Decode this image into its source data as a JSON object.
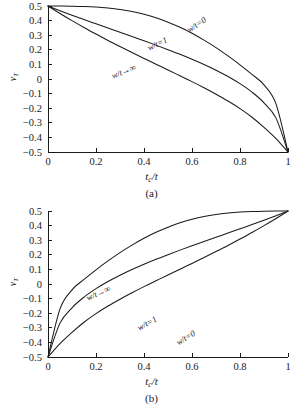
{
  "figure": {
    "background": "#ffffff",
    "line_color": "#1a1a1a"
  },
  "panels": [
    {
      "id": "a",
      "caption": "(a)",
      "xlabel_main": "t",
      "xlabel_sub": "c",
      "xlabel_tail": "/t",
      "ylabel_main": "ν",
      "ylabel_sub": "T",
      "labels": [
        {
          "name": "w-over-t-zero",
          "text": "w/t=0",
          "x": 188,
          "y": 26,
          "rot": -33
        },
        {
          "name": "w-over-t-one",
          "text": "w/t=1",
          "x": 148,
          "y": 44,
          "rot": -25
        },
        {
          "name": "w-over-t-infinity",
          "text": "w/t→∞",
          "x": 112,
          "y": 72,
          "rot": -22
        }
      ]
    },
    {
      "id": "b",
      "caption": "(b)",
      "xlabel_main": "t",
      "xlabel_sub": "c",
      "xlabel_tail": "/t",
      "ylabel_main": "ν",
      "ylabel_sub": "T",
      "labels": [
        {
          "name": "w-over-t-infinity",
          "text": "w/t→∞",
          "x": 87,
          "y": 89,
          "rot": -24
        },
        {
          "name": "w-over-t-one",
          "text": "w/t=1",
          "x": 138,
          "y": 119,
          "rot": -28
        },
        {
          "name": "w-over-t-zero",
          "text": "w/t=0",
          "x": 177,
          "y": 134,
          "rot": -32
        }
      ]
    }
  ],
  "chart_data": [
    {
      "type": "line",
      "panel": "(a)",
      "title": "",
      "xlabel": "t_c/t",
      "ylabel": "nu_T",
      "xlim": [
        0,
        1
      ],
      "ylim": [
        -0.5,
        0.5
      ],
      "grid": false,
      "legend": "inline-curve-labels",
      "xticks": [
        "0",
        "0.2",
        "0.4",
        "0.6",
        "0.8",
        "1"
      ],
      "xtick_values": [
        0,
        0.2,
        0.4,
        0.6,
        0.8,
        1
      ],
      "yticks": [
        "0.5",
        "0.4",
        "0.3",
        "0.2",
        "0.1",
        "0",
        "-0.1",
        "-0.2",
        "-0.3",
        "-0.4",
        "-0.5"
      ],
      "ytick_values": [
        0.5,
        0.4,
        0.3,
        0.2,
        0.1,
        0,
        -0.1,
        -0.2,
        -0.3,
        -0.4,
        -0.5
      ],
      "x": [
        0,
        0.05,
        0.1,
        0.15,
        0.2,
        0.25,
        0.3,
        0.35,
        0.4,
        0.45,
        0.5,
        0.55,
        0.6,
        0.65,
        0.7,
        0.75,
        0.8,
        0.85,
        0.9,
        0.95,
        1
      ],
      "series": [
        {
          "name": "w/t=0",
          "values": [
            0.5,
            0.5,
            0.499,
            0.497,
            0.493,
            0.486,
            0.476,
            0.462,
            0.443,
            0.419,
            0.389,
            0.354,
            0.313,
            0.266,
            0.215,
            0.158,
            0.097,
            0.031,
            -0.04,
            -0.17,
            -0.5
          ]
        },
        {
          "name": "w/t=1",
          "values": [
            0.5,
            0.468,
            0.437,
            0.407,
            0.378,
            0.349,
            0.32,
            0.291,
            0.262,
            0.232,
            0.201,
            0.169,
            0.135,
            0.099,
            0.06,
            0.017,
            -0.032,
            -0.09,
            -0.163,
            -0.268,
            -0.5
          ]
        },
        {
          "name": "w/t→∞",
          "values": [
            0.5,
            0.449,
            0.4,
            0.353,
            0.308,
            0.264,
            0.222,
            0.181,
            0.141,
            0.101,
            0.062,
            0.022,
            -0.018,
            -0.06,
            -0.104,
            -0.151,
            -0.203,
            -0.262,
            -0.331,
            -0.408,
            -0.5
          ]
        }
      ]
    },
    {
      "type": "line",
      "panel": "(b)",
      "title": "",
      "xlabel": "t_c/t",
      "ylabel": "nu_T",
      "xlim": [
        0,
        1
      ],
      "ylim": [
        -0.5,
        0.5
      ],
      "grid": false,
      "legend": "inline-curve-labels",
      "xticks": [
        "0",
        "0.2",
        "0.4",
        "0.6",
        "0.8",
        "1"
      ],
      "xtick_values": [
        0,
        0.2,
        0.4,
        0.6,
        0.8,
        1
      ],
      "yticks": [
        "0.5",
        "0.4",
        "0.3",
        "0.2",
        "0.1",
        "0",
        "-0.1",
        "-0.2",
        "-0.3",
        "-0.4",
        "-0.5"
      ],
      "ytick_values": [
        0.5,
        0.4,
        0.3,
        0.2,
        0.1,
        0,
        -0.1,
        -0.2,
        -0.3,
        -0.4,
        -0.5
      ],
      "x": [
        0,
        0.05,
        0.1,
        0.15,
        0.2,
        0.25,
        0.3,
        0.35,
        0.4,
        0.45,
        0.5,
        0.55,
        0.6,
        0.65,
        0.7,
        0.75,
        0.8,
        0.85,
        0.9,
        0.95,
        1
      ],
      "series": [
        {
          "name": "w/t→∞",
          "values": [
            -0.5,
            -0.408,
            -0.331,
            -0.262,
            -0.203,
            -0.151,
            -0.104,
            -0.06,
            -0.018,
            0.022,
            0.062,
            0.101,
            0.141,
            0.181,
            0.222,
            0.264,
            0.308,
            0.353,
            0.4,
            0.449,
            0.5
          ]
        },
        {
          "name": "w/t=1",
          "values": [
            -0.5,
            -0.268,
            -0.163,
            -0.09,
            -0.032,
            0.017,
            0.06,
            0.099,
            0.135,
            0.169,
            0.201,
            0.232,
            0.262,
            0.291,
            0.32,
            0.349,
            0.378,
            0.407,
            0.437,
            0.468,
            0.5
          ]
        },
        {
          "name": "w/t=0",
          "values": [
            -0.5,
            -0.17,
            -0.04,
            0.031,
            0.097,
            0.158,
            0.215,
            0.266,
            0.313,
            0.354,
            0.389,
            0.419,
            0.443,
            0.462,
            0.476,
            0.486,
            0.493,
            0.497,
            0.499,
            0.5,
            0.5
          ]
        }
      ]
    }
  ]
}
